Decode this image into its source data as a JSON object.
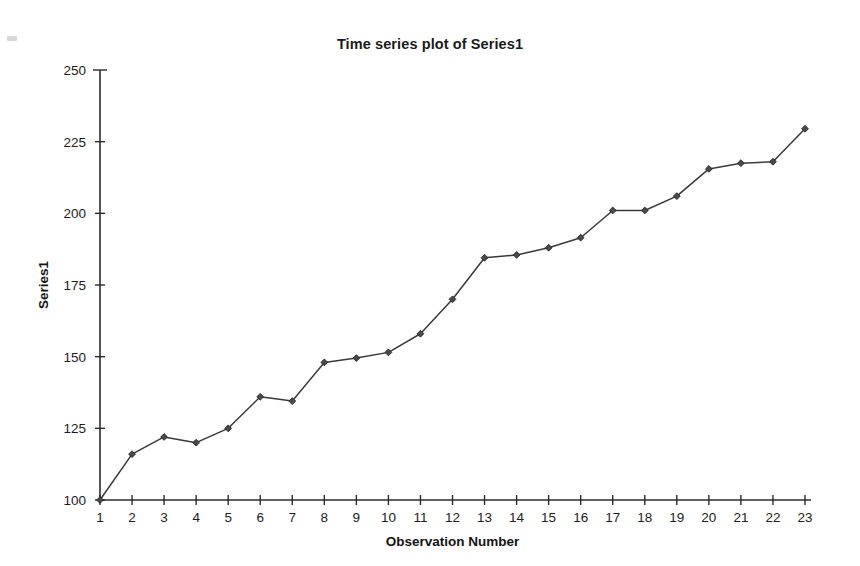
{
  "chart_data": {
    "type": "line",
    "title": "Time series plot of Series1",
    "xlabel": "Observation Number",
    "ylabel": "Series1",
    "x": [
      1,
      2,
      3,
      4,
      5,
      6,
      7,
      8,
      9,
      10,
      11,
      12,
      13,
      14,
      15,
      16,
      17,
      18,
      19,
      20,
      21,
      22,
      23
    ],
    "values": [
      100,
      116,
      122,
      120,
      125,
      136,
      134.5,
      148,
      149.5,
      151.5,
      158,
      170,
      184.5,
      185.5,
      188,
      191.5,
      201,
      201,
      206,
      215.5,
      217.5,
      218,
      229.5
    ],
    "series": [
      {
        "name": "Series1",
        "values": [
          100,
          116,
          122,
          120,
          125,
          136,
          134.5,
          148,
          149.5,
          151.5,
          158,
          170,
          184.5,
          185.5,
          188,
          191.5,
          201,
          201,
          206,
          215.5,
          217.5,
          218,
          229.5
        ]
      }
    ],
    "xlim": [
      1,
      23
    ],
    "ylim": [
      100,
      250
    ],
    "xticks": [
      "1",
      "2",
      "3",
      "4",
      "5",
      "6",
      "7",
      "8",
      "9",
      "10",
      "11",
      "12",
      "13",
      "14",
      "15",
      "16",
      "17",
      "18",
      "19",
      "20",
      "21",
      "22",
      "23"
    ],
    "yticks": [
      "100",
      "125",
      "150",
      "175",
      "200",
      "225",
      "250"
    ],
    "ytick_values": [
      100,
      125,
      150,
      175,
      200,
      225,
      250
    ],
    "grid": false,
    "legend": false,
    "legend_position": "none",
    "marker": "diamond",
    "line_color": "#3a3a3a",
    "marker_color": "#4a4a4a"
  },
  "canvas": {
    "width": 860,
    "height": 566,
    "background": "#ffffff"
  }
}
